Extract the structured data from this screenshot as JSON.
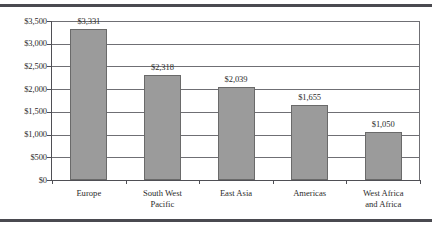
{
  "figure": {
    "background_color": "#ffffff",
    "rule_color": "#4a4a50",
    "bar_fill_color": "#9b9b9b",
    "bar_border_color": "#6a6a6a",
    "gridline_color": "#6f6f74",
    "axis_color": "#4f4f55",
    "text_color": "#2b2b2b"
  },
  "chart_data": {
    "type": "bar",
    "title": "",
    "subtitle": "",
    "xlabel": "",
    "ylabel": "",
    "categories": [
      "Europe",
      "South West\nPacific",
      "East Asia",
      "Americas",
      "West Africa\nand Africa"
    ],
    "values": [
      3331,
      2318,
      2039,
      1655,
      1050
    ],
    "data_labels": [
      "$3,331",
      "$2,318",
      "$2,039",
      "$1,655",
      "$1,050"
    ],
    "ylim": [
      0,
      3500
    ],
    "ytick_values": [
      0,
      500,
      1000,
      1500,
      2000,
      2500,
      3000,
      3500
    ],
    "ytick_labels": [
      "$0",
      "$500",
      "$1,000",
      "$1,500",
      "$2,000",
      "$2,500",
      "$3,000",
      "$3,500"
    ],
    "grid": "horizontal",
    "legend": "none",
    "orientation": "vertical",
    "series": [
      {
        "name": "",
        "values": [
          3331,
          2318,
          2039,
          1655,
          1050
        ]
      }
    ]
  }
}
